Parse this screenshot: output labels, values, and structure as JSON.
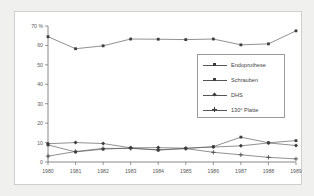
{
  "chart_data": {
    "type": "line",
    "title": "",
    "subtitle": "",
    "xlabel": "",
    "ylabel": "",
    "categories": [
      "1980",
      "1981",
      "1982",
      "1983",
      "1984",
      "1985",
      "1986",
      "1987",
      "1988",
      "1989"
    ],
    "x": [
      1980,
      1981,
      1982,
      1983,
      1984,
      1985,
      1986,
      1987,
      1988,
      1989
    ],
    "ylim": [
      0,
      70
    ],
    "xlim": [
      1980,
      1989
    ],
    "yticks": [
      0,
      10,
      20,
      30,
      40,
      50,
      60,
      70
    ],
    "ytick_labels": [
      "0",
      "10",
      "20",
      "30",
      "40",
      "50",
      "60",
      "70 %"
    ],
    "xtick_labels": [
      "1980",
      "1981",
      "1982",
      "1983",
      "1984",
      "1985",
      "1986",
      "1987",
      "1988",
      "1989"
    ],
    "grid": false,
    "legend_position": "center-right",
    "series": [
      {
        "name": "Endoprothese",
        "marker": "square",
        "color": "#3d3d3d",
        "values": [
          64.5,
          58.3,
          59.8,
          63.3,
          63.2,
          63.0,
          63.3,
          60.3,
          60.8,
          67.5
        ]
      },
      {
        "name": "Schrauben",
        "marker": "square",
        "color": "#3d3d3d",
        "values": [
          8.8,
          5.2,
          6.6,
          7.2,
          6.1,
          7.0,
          7.9,
          12.8,
          9.9,
          11.0
        ]
      },
      {
        "name": "DHS",
        "marker": "diamond",
        "color": "#3d3d3d",
        "values": [
          9.4,
          10.0,
          9.5,
          7.3,
          7.4,
          7.1,
          7.7,
          8.3,
          9.8,
          8.5
        ]
      },
      {
        "name": "130° Platte",
        "marker": "cross",
        "color": "#3d3d3d",
        "values": [
          3.0,
          5.4,
          7.0,
          7.0,
          6.3,
          6.9,
          5.0,
          3.7,
          2.4,
          1.6
        ]
      }
    ]
  },
  "legend": {
    "items": [
      {
        "label": "Endoprothese"
      },
      {
        "label": "Schrauben"
      },
      {
        "label": "DHS"
      },
      {
        "label": "130° Platte"
      }
    ]
  },
  "colors": {
    "figure_background": "#f0f0ee",
    "panel_background": "#ffffff",
    "axis": "#6b6b6b",
    "series": "#3d3d3d",
    "text": "#5a5a5a"
  }
}
